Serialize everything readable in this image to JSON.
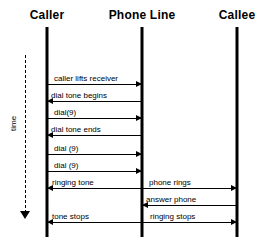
{
  "diagram": {
    "type": "sequence-diagram",
    "time_axis": {
      "label": "time",
      "direction": "downward"
    },
    "lifelines": [
      {
        "id": "caller",
        "label": "Caller",
        "x": 47
      },
      {
        "id": "phone-line",
        "label": "Phone Line",
        "x": 142
      },
      {
        "id": "callee",
        "label": "Callee",
        "x": 237
      }
    ],
    "messages": [
      {
        "label": "caller lifts receiver",
        "from": "caller",
        "to": "phone-line",
        "direction": "right",
        "y": 76
      },
      {
        "label": "dial tone begins",
        "from": "phone-line",
        "to": "caller",
        "direction": "left",
        "y": 93
      },
      {
        "label": "dial(9)",
        "from": "caller",
        "to": "phone-line",
        "direction": "right",
        "y": 110
      },
      {
        "label": "dial tone ends",
        "from": "phone-line",
        "to": "caller",
        "direction": "left",
        "y": 127
      },
      {
        "label": "dial (9)",
        "from": "caller",
        "to": "phone-line",
        "direction": "right",
        "y": 146
      },
      {
        "label": "dial (9)",
        "from": "caller",
        "to": "phone-line",
        "direction": "right",
        "y": 163
      },
      {
        "label": "ringing tone",
        "from": "phone-line",
        "to": "caller",
        "direction": "left",
        "y": 180
      },
      {
        "label": "phone rings",
        "from": "phone-line",
        "to": "callee",
        "direction": "right",
        "y": 180
      },
      {
        "label": "answer phone",
        "from": "callee",
        "to": "phone-line",
        "direction": "left",
        "y": 197
      },
      {
        "label": "tone stops",
        "from": "phone-line",
        "to": "caller",
        "direction": "left",
        "y": 214
      },
      {
        "label": "ringing stops",
        "from": "phone-line",
        "to": "callee",
        "direction": "right",
        "y": 214
      }
    ],
    "colors": {
      "background": "#ffffff",
      "stroke": "#000000",
      "text": "#000000"
    }
  }
}
